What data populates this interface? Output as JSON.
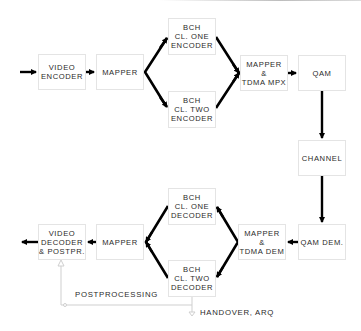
{
  "diagram": {
    "type": "block-diagram",
    "title": "",
    "colors": {
      "arrow": "#000000",
      "box_border": "#e4e4e4",
      "text": "#2a2a2a",
      "feedback_line": "#cfcfcf"
    },
    "transmitter": {
      "video_encoder": "VIDEO\nENCODER",
      "mapper": "MAPPER",
      "bch_one_encoder": "BCH\nCL. ONE\nENCODER",
      "bch_two_encoder": "BCH\nCL. TWO\nENCODER",
      "mapper_tdma_mpx": "MAPPER\n&\nTDMA MPX",
      "qam": "QAM"
    },
    "channel": "CHANNEL",
    "receiver": {
      "qam_dem": "QAM DEM.",
      "mapper_tdma_dem": "MAPPER\n&\nTDMA DEM",
      "bch_one_decoder": "BCH\nCL. ONE\nDECODER",
      "bch_two_decoder": "BCH\nCL. TWO\nDECODER",
      "mapper": "MAPPER",
      "video_decoder": "VIDEO\nDECODER\n& POSTPR."
    },
    "annotations": {
      "postprocessing": "POSTPROCESSING",
      "handover": "HANDOVER, ARQ"
    },
    "edges": [
      [
        "input",
        "video_encoder"
      ],
      [
        "video_encoder",
        "mapper"
      ],
      [
        "mapper",
        "bch_one_encoder"
      ],
      [
        "mapper",
        "bch_two_encoder"
      ],
      [
        "bch_one_encoder",
        "mapper_tdma_mpx"
      ],
      [
        "bch_two_encoder",
        "mapper_tdma_mpx"
      ],
      [
        "mapper_tdma_mpx",
        "qam"
      ],
      [
        "qam",
        "channel"
      ],
      [
        "channel",
        "qam_dem"
      ],
      [
        "qam_dem",
        "mapper_tdma_dem"
      ],
      [
        "mapper_tdma_dem",
        "bch_one_decoder"
      ],
      [
        "mapper_tdma_dem",
        "bch_two_decoder"
      ],
      [
        "bch_one_decoder",
        "rx_mapper"
      ],
      [
        "bch_two_decoder",
        "rx_mapper"
      ],
      [
        "rx_mapper",
        "video_decoder"
      ],
      [
        "video_decoder",
        "output"
      ],
      [
        "bch_two_decoder",
        "video_decoder",
        "POSTPROCESSING"
      ],
      [
        "bch_two_decoder",
        "handover",
        "HANDOVER, ARQ"
      ]
    ]
  }
}
